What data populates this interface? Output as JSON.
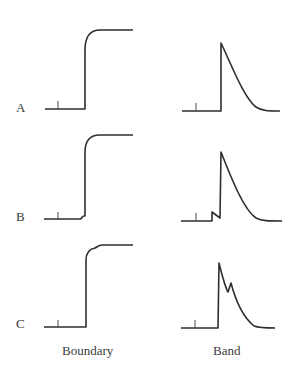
{
  "rows": [
    {
      "label": "A"
    },
    {
      "label": "B"
    },
    {
      "label": "C"
    }
  ],
  "columns": [
    {
      "label": "Boundary"
    },
    {
      "label": "Band"
    }
  ],
  "colors": {
    "stroke": "#2e2e2e",
    "text": "#3a3a3a",
    "background": "#ffffff"
  }
}
